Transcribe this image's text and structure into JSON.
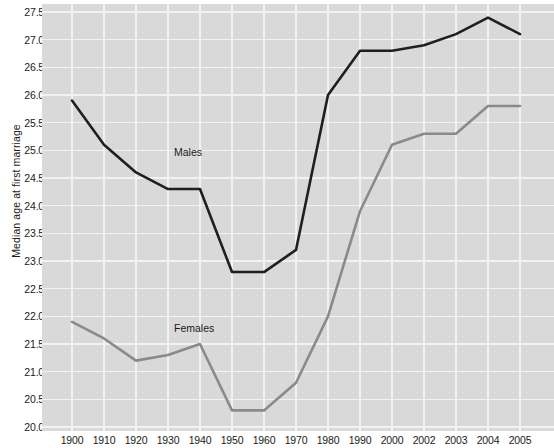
{
  "chart_data": {
    "type": "line",
    "title": "",
    "xlabel": "",
    "ylabel": "Median age at first marriage",
    "x": [
      "1900",
      "1910",
      "1920",
      "1930",
      "1940",
      "1950",
      "1960",
      "1970",
      "1980",
      "1990",
      "2000",
      "2002",
      "2003",
      "2004",
      "2005"
    ],
    "xtick_labels": [
      "1900",
      "1910",
      "1920",
      "1930",
      "1940",
      "1950",
      "1960",
      "1970",
      "1980",
      "1990",
      "2000",
      "2002",
      "2003",
      "2004",
      "2005"
    ],
    "ytick_labels": [
      "27.5",
      "27.0",
      "26.5",
      "26.0",
      "25.5",
      "25.0",
      "24.5",
      "24.0",
      "23.5",
      "23.0",
      "22.5",
      "22.0",
      "21.5",
      "21.0",
      "20.5",
      "20.0"
    ],
    "ytick_values": [
      27.5,
      27.0,
      26.5,
      26.0,
      25.5,
      25.0,
      24.5,
      24.0,
      23.5,
      23.0,
      22.5,
      22.0,
      21.5,
      21.0,
      20.5,
      20.0
    ],
    "ylim": [
      20.0,
      27.5
    ],
    "grid": true,
    "legend_position": "inline-annotation",
    "series": [
      {
        "name": "Males",
        "color": "#1f1f1f",
        "label_x": 1930,
        "label_y": 24.95,
        "values": [
          25.9,
          25.1,
          24.6,
          24.3,
          24.3,
          22.8,
          22.8,
          23.2,
          26.0,
          26.8,
          26.8,
          26.9,
          27.1,
          27.4,
          27.1
        ]
      },
      {
        "name": "Females",
        "color": "#8a8a8a",
        "label_x": 1930,
        "label_y": 21.78,
        "values": [
          21.9,
          21.6,
          21.2,
          21.3,
          21.5,
          20.3,
          20.3,
          20.8,
          22.0,
          23.9,
          25.1,
          25.3,
          25.3,
          25.8,
          25.8
        ]
      }
    ],
    "plot_background": "#d9d9d9",
    "gridline_color": "#f2f2f2"
  }
}
